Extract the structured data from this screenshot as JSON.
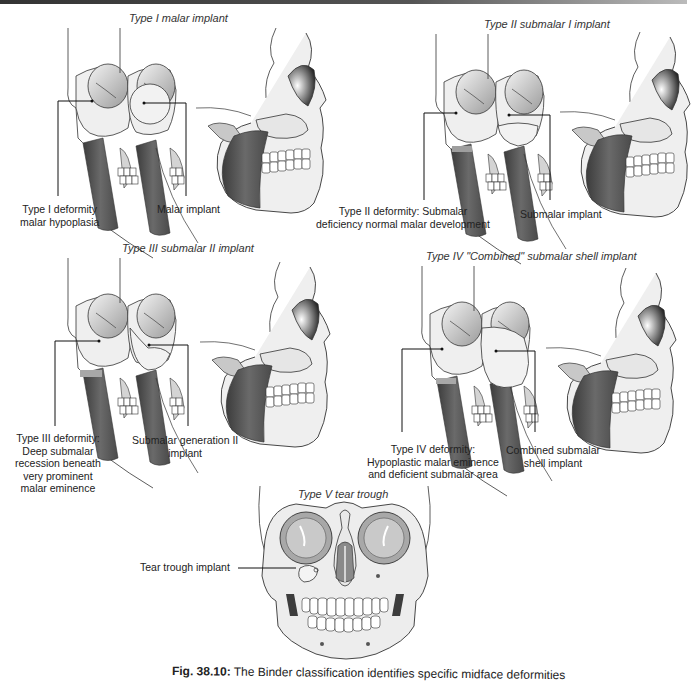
{
  "figure": {
    "number": "Fig. 38.10:",
    "caption": "The Binder classification identifies specific midface deformities"
  },
  "panels": [
    {
      "title": "Type I malar implant",
      "left_label": [
        "Type I deformity",
        "malar hypoplasia"
      ],
      "right_label": [
        "Malar implant"
      ]
    },
    {
      "title": "Type II submalar I implant",
      "left_label": [
        "Type II deformity: Submalar",
        "deficiency normal malar development"
      ],
      "right_label": [
        "Submalar implant"
      ]
    },
    {
      "title": "Type III submalar II implant",
      "left_label": [
        "Type III deformity:",
        "Deep submalar",
        "recession beneath",
        "very prominent",
        "malar eminence"
      ],
      "right_label": [
        "Submalar generation II",
        "implant"
      ]
    },
    {
      "title": "Type IV \"Combined\" submalar shell implant",
      "left_label": [
        "Type IV deformity:",
        "Hypoplastic malar eminence",
        "and deficient submalar area"
      ],
      "right_label": [
        "Combined submalar",
        "shell implant"
      ]
    },
    {
      "title": "Type V tear trough",
      "left_label": [
        "Tear trough implant"
      ]
    }
  ],
  "colors": {
    "muscle": "#5a5a5a",
    "bone": "#ededed",
    "outline": "#333333",
    "implant_highlight": "#bdbdbd"
  }
}
